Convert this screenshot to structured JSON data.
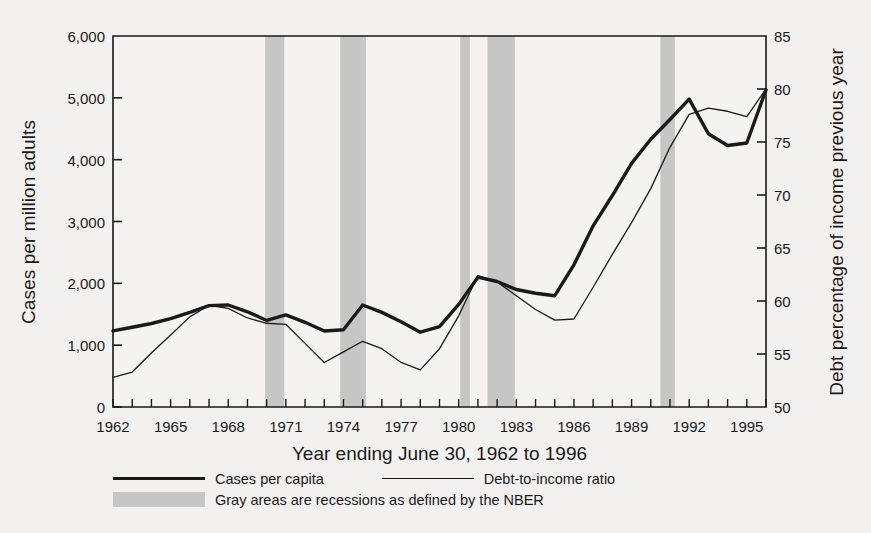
{
  "chart_data": {
    "type": "line",
    "title": "",
    "xlabel": "Year ending June 30, 1962 to 1996",
    "ylabel": "Cases per million adults",
    "ylabel_right": "Debt percentage of income previous year",
    "grid": false,
    "legend_position": "bottom",
    "x": [
      1962,
      1963,
      1964,
      1965,
      1966,
      1967,
      1968,
      1969,
      1970,
      1971,
      1972,
      1973,
      1974,
      1975,
      1976,
      1977,
      1978,
      1979,
      1980,
      1981,
      1982,
      1983,
      1984,
      1985,
      1986,
      1987,
      1988,
      1989,
      1990,
      1991,
      1992,
      1993,
      1994,
      1995,
      1996
    ],
    "xlim": [
      1962,
      1996
    ],
    "ylim": [
      0,
      6000
    ],
    "ylim_right": [
      50,
      85
    ],
    "yticks": [
      0,
      1000,
      2000,
      3000,
      4000,
      5000,
      6000
    ],
    "ytick_labels": [
      "0",
      "1,000",
      "2,000",
      "3,000",
      "4,000",
      "5,000",
      "6,000"
    ],
    "yticks_right": [
      50,
      55,
      60,
      65,
      70,
      75,
      80,
      85
    ],
    "ytick_labels_right": [
      "50",
      "55",
      "60",
      "65",
      "70",
      "75",
      "80",
      "85"
    ],
    "xticks": [
      1962,
      1963,
      1964,
      1965,
      1966,
      1967,
      1968,
      1969,
      1970,
      1971,
      1972,
      1973,
      1974,
      1975,
      1976,
      1977,
      1978,
      1979,
      1980,
      1981,
      1982,
      1983,
      1984,
      1985,
      1986,
      1987,
      1988,
      1989,
      1990,
      1991,
      1992,
      1993,
      1994,
      1995,
      1996
    ],
    "xtick_labels_shown": [
      "1962",
      "1965",
      "1968",
      "1971",
      "1974",
      "1977",
      "1980",
      "1983",
      "1986",
      "1989",
      "1992",
      "1995"
    ],
    "series": [
      {
        "name": "Cases per capita",
        "axis": "left",
        "style": "thick",
        "color": "#1a1a1a",
        "values": [
          1230,
          1290,
          1350,
          1430,
          1530,
          1640,
          1650,
          1540,
          1400,
          1490,
          1370,
          1230,
          1250,
          1650,
          1530,
          1380,
          1210,
          1300,
          1660,
          2100,
          2030,
          1900,
          1840,
          1800,
          2300,
          2930,
          3420,
          3940,
          4330,
          4650,
          4980,
          4420,
          4230,
          4270,
          5130
        ]
      },
      {
        "name": "Debt-to-income ratio",
        "axis": "right",
        "style": "thin",
        "color": "#1a1a1a",
        "values": [
          52.8,
          53.3,
          55.1,
          56.8,
          58.5,
          59.6,
          59.3,
          58.4,
          57.9,
          57.8,
          56.0,
          54.2,
          55.2,
          56.2,
          55.5,
          54.2,
          53.5,
          55.5,
          58.6,
          62.4,
          61.8,
          60.5,
          59.2,
          58.2,
          58.3,
          61.3,
          64.4,
          67.4,
          70.6,
          74.5,
          77.6,
          78.2,
          77.9,
          77.4,
          80.0
        ]
      }
    ],
    "recessions": [
      {
        "start": 1969.92,
        "end": 1970.92
      },
      {
        "start": 1973.83,
        "end": 1975.17
      },
      {
        "start": 1980.08,
        "end": 1980.58
      },
      {
        "start": 1981.5,
        "end": 1982.92
      },
      {
        "start": 1990.5,
        "end": 1991.25
      }
    ],
    "legend": [
      {
        "label": "Cases per capita",
        "marker": "thick-line"
      },
      {
        "label": "Debt-to-income ratio",
        "marker": "thin-line"
      },
      {
        "label": "Gray areas are recessions as defined by the NBER",
        "marker": "gray-swatch"
      }
    ],
    "colors": {
      "background": "#f2f1ef",
      "plot_background": "#f4f3f1",
      "line": "#1a1a1a",
      "recession_band": "#c6c6c6",
      "axis": "#1a1a1a"
    }
  }
}
